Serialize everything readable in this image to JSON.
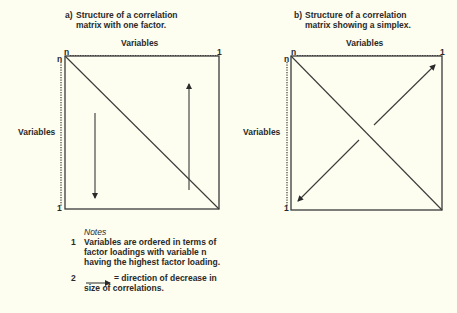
{
  "diagram_a": {
    "label": "a)",
    "caption": "Structure of a correlation matrix with one factor.",
    "x_axis_label": "Variables",
    "y_axis_label": "Variables",
    "top_left": "n",
    "top_right": "1",
    "left_top": "n",
    "left_bottom": "1"
  },
  "diagram_b": {
    "label": "b)",
    "caption": "Structure of a correlation matrix showing a simplex.",
    "x_axis_label": "Variables",
    "y_axis_label": "Variables",
    "top_left": "n",
    "top_right": "1",
    "left_top": "n",
    "left_bottom": "1"
  },
  "notes": {
    "title": "Notes",
    "items": [
      {
        "num": "1",
        "text": "Variables are ordered in terms of factor loadings with variable n having the highest factor loading."
      },
      {
        "num": "2",
        "text": "= direction of decrease in size of correlations."
      }
    ]
  },
  "colors": {
    "background": "#fdfdf0",
    "ink": "#2a2a2a"
  }
}
